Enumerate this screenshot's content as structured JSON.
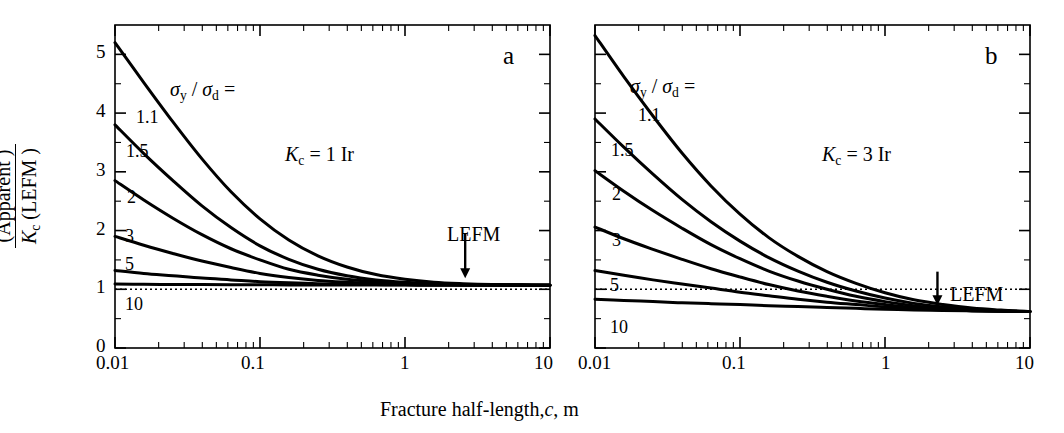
{
  "figure": {
    "x_axis_label_parts": {
      "main": "Fracture half-length,",
      "var": "c",
      "unit": ", m"
    },
    "y_axis_label": {
      "numerator_sym": "K",
      "numerator_sub": "α",
      "numerator_txt": " (Apparent )",
      "denominator_sym": "K",
      "denominator_sub": "c",
      "denominator_txt": " (LEFM )"
    }
  },
  "panels": [
    {
      "id": "a",
      "label": "a",
      "annotation": {
        "sym": "K",
        "sub": "c",
        "rest": " = 1 Ir"
      },
      "legend_title": {
        "s1": "σ",
        "sub1": "y",
        "slash": " / ",
        "s2": "σ",
        "sub2": "d",
        "eq": " ="
      },
      "arrow_label": "LEFM",
      "x_ticks": [
        "0.01",
        "0.1",
        "1",
        "10"
      ],
      "y_ticks": [
        "0",
        "1",
        "2",
        "3",
        "4",
        "5"
      ],
      "curve_labels": [
        "1.1",
        "1.5",
        "2",
        "3",
        "5",
        "10"
      ],
      "reference_line_value": 1.0
    },
    {
      "id": "b",
      "label": "b",
      "annotation": {
        "sym": "K",
        "sub": "c",
        "rest": " = 3 Ir"
      },
      "legend_title": {
        "s1": "σ",
        "sub1": "y",
        "slash": " / ",
        "s2": "σ",
        "sub2": "d",
        "eq": " ="
      },
      "arrow_label": "LEFM",
      "x_ticks": [
        "0.01",
        "0.1",
        "1",
        "10"
      ],
      "y_ticks": [
        "",
        "",
        "",
        "",
        "",
        ""
      ],
      "curve_labels": [
        "1.1",
        "1.5",
        "2",
        "3",
        "5",
        "10"
      ],
      "reference_line_value": 1.0
    }
  ],
  "chart_data": {
    "type": "line",
    "title": "",
    "xlabel": "Fracture half-length, c, m",
    "ylabel": "K_alpha (Apparent) / K_c (LEFM)",
    "xscale": "log",
    "xlim": [
      0.01,
      10
    ],
    "ylim": [
      0,
      5.5
    ],
    "grid": false,
    "legend": "inline curve labels",
    "x": [
      0.01,
      0.0158,
      0.0251,
      0.0398,
      0.0631,
      0.1,
      0.158,
      0.251,
      0.398,
      0.631,
      1.0,
      1.58,
      2.51,
      3.98,
      6.31,
      10.0
    ],
    "panels": [
      {
        "name": "a",
        "annotation": "K_c = 1 Ir",
        "asymptote": 1.07,
        "reference_line": 1.0,
        "series": [
          {
            "name": "1.1",
            "values": [
              5.2,
              4.52,
              3.85,
              3.22,
              2.66,
              2.2,
              1.84,
              1.57,
              1.38,
              1.25,
              1.17,
              1.12,
              1.095,
              1.08,
              1.075,
              1.07
            ]
          },
          {
            "name": "1.5",
            "values": [
              3.8,
              3.31,
              2.85,
              2.42,
              2.05,
              1.74,
              1.51,
              1.34,
              1.23,
              1.16,
              1.12,
              1.095,
              1.082,
              1.075,
              1.071,
              1.07
            ]
          },
          {
            "name": "2",
            "values": [
              2.85,
              2.52,
              2.21,
              1.93,
              1.69,
              1.5,
              1.34,
              1.24,
              1.17,
              1.13,
              1.1,
              1.086,
              1.078,
              1.073,
              1.071,
              1.07
            ]
          },
          {
            "name": "3",
            "values": [
              1.9,
              1.75,
              1.61,
              1.48,
              1.37,
              1.27,
              1.2,
              1.15,
              1.12,
              1.098,
              1.085,
              1.078,
              1.074,
              1.072,
              1.07,
              1.07
            ]
          },
          {
            "name": "5",
            "values": [
              1.32,
              1.27,
              1.23,
              1.19,
              1.16,
              1.13,
              1.11,
              1.095,
              1.086,
              1.08,
              1.076,
              1.073,
              1.072,
              1.071,
              1.07,
              1.07
            ]
          },
          {
            "name": "10",
            "values": [
              1.09,
              1.085,
              1.082,
              1.08,
              1.078,
              1.076,
              1.074,
              1.073,
              1.072,
              1.071,
              1.071,
              1.07,
              1.07,
              1.07,
              1.07,
              1.07
            ]
          }
        ]
      },
      {
        "name": "b",
        "annotation": "K_c = 3 Ir",
        "asymptote": 0.62,
        "reference_line": 1.0,
        "series": [
          {
            "name": "1.1",
            "values": [
              5.32,
              4.62,
              3.95,
              3.32,
              2.76,
              2.28,
              1.88,
              1.56,
              1.3,
              1.1,
              0.94,
              0.82,
              0.74,
              0.68,
              0.645,
              0.62
            ]
          },
          {
            "name": "1.5",
            "values": [
              3.9,
              3.42,
              2.96,
              2.53,
              2.15,
              1.82,
              1.54,
              1.31,
              1.12,
              0.97,
              0.85,
              0.76,
              0.7,
              0.66,
              0.635,
              0.62
            ]
          },
          {
            "name": "2",
            "values": [
              3.02,
              2.67,
              2.34,
              2.04,
              1.76,
              1.52,
              1.31,
              1.14,
              1.0,
              0.88,
              0.79,
              0.72,
              0.675,
              0.645,
              0.63,
              0.62
            ]
          },
          {
            "name": "3",
            "values": [
              2.06,
              1.86,
              1.68,
              1.51,
              1.35,
              1.21,
              1.08,
              0.97,
              0.88,
              0.8,
              0.74,
              0.69,
              0.66,
              0.64,
              0.628,
              0.62
            ]
          },
          {
            "name": "5",
            "values": [
              1.32,
              1.24,
              1.16,
              1.09,
              1.02,
              0.95,
              0.89,
              0.83,
              0.78,
              0.74,
              0.7,
              0.67,
              0.65,
              0.635,
              0.625,
              0.62
            ]
          },
          {
            "name": "10",
            "values": [
              0.83,
              0.81,
              0.79,
              0.77,
              0.755,
              0.74,
              0.72,
              0.705,
              0.69,
              0.675,
              0.66,
              0.648,
              0.638,
              0.631,
              0.625,
              0.62
            ]
          }
        ]
      }
    ]
  }
}
